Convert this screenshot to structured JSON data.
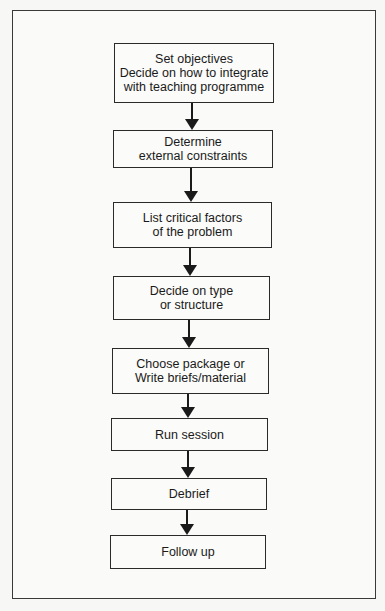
{
  "diagram": {
    "type": "flowchart",
    "direction": "top-to-bottom",
    "steps": [
      {
        "id": "s1",
        "label": "Set objectives\nDecide on how to integrate\nwith teaching programme"
      },
      {
        "id": "s2",
        "label": "Determine\nexternal constraints"
      },
      {
        "id": "s3",
        "label": "List critical factors\nof the problem"
      },
      {
        "id": "s4",
        "label": "Decide on type\nor structure"
      },
      {
        "id": "s5",
        "label": "Choose package or\nWrite briefs/material"
      },
      {
        "id": "s6",
        "label": "Run session"
      },
      {
        "id": "s7",
        "label": "Debrief"
      },
      {
        "id": "s8",
        "label": "Follow up"
      }
    ],
    "edges": [
      [
        "s1",
        "s2"
      ],
      [
        "s2",
        "s3"
      ],
      [
        "s3",
        "s4"
      ],
      [
        "s4",
        "s5"
      ],
      [
        "s5",
        "s6"
      ],
      [
        "s6",
        "s7"
      ],
      [
        "s7",
        "s8"
      ]
    ]
  }
}
